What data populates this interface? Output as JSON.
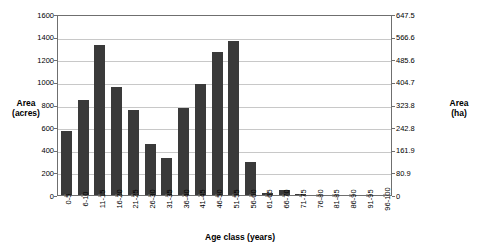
{
  "chart_data": {
    "type": "bar",
    "title": "",
    "xlabel": "Age class (years)",
    "ylabel": "Area\n(acres)",
    "ylabel_secondary": "Area\n(ha)",
    "categories": [
      "0-5",
      "6-10",
      "11-15",
      "16-20",
      "21-25",
      "26-30",
      "31-35",
      "36-40",
      "41-45",
      "46-50",
      "51-55",
      "56-60",
      "61-65",
      "66-70",
      "71-75",
      "76-80",
      "81-85",
      "86-90",
      "91-95",
      "96-100"
    ],
    "values": [
      570,
      840,
      1325,
      955,
      755,
      455,
      325,
      770,
      980,
      1265,
      1360,
      290,
      15,
      45,
      8,
      0,
      0,
      0,
      0,
      0
    ],
    "ylim": [
      0,
      1600
    ],
    "yticks": [
      0,
      200,
      400,
      600,
      800,
      1000,
      1200,
      1400,
      1600
    ],
    "ylim_secondary": [
      0,
      647.5
    ],
    "yticks_secondary": [
      "0",
      "80.9",
      "161.9",
      "242.8",
      "323.8",
      "404.7",
      "485.6",
      "566.6",
      "647.5"
    ],
    "grid": true,
    "legend": "none",
    "bar_color": "#3a3a3a",
    "grid_color": "#c8c8c8",
    "axis_color": "#6f6f6f"
  }
}
